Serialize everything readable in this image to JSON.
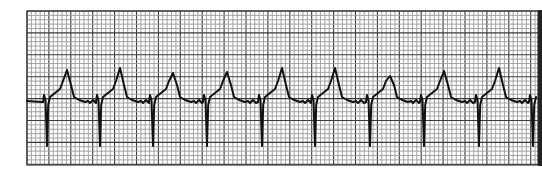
{
  "figure": {
    "lead_label": ""
  },
  "colors": {
    "paper": "#ffffff",
    "grid_minor": "#9a9a9a",
    "grid_major": "#3a3a3a",
    "trace": "#111111",
    "edge": "#222222"
  },
  "rhythm": {
    "beat_count_visible": 10,
    "description": "Regular rhythm with narrow pacing-like spikes followed by deep negative deflections and tall peaked T waves",
    "beats": [
      {
        "index": 1
      },
      {
        "index": 2
      },
      {
        "index": 3
      },
      {
        "index": 4
      },
      {
        "index": 5
      },
      {
        "index": 6
      },
      {
        "index": 7
      },
      {
        "index": 8
      },
      {
        "index": 9
      },
      {
        "index": 10
      }
    ]
  }
}
